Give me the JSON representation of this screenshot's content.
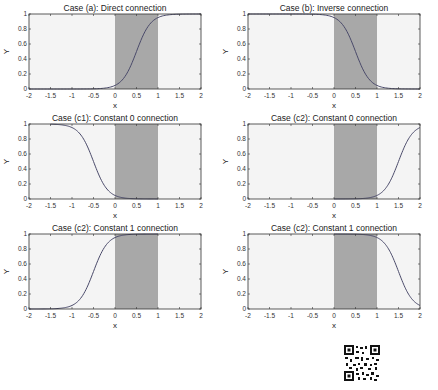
{
  "chart_data": [
    {
      "type": "line",
      "title": "Case (a): Direct connection",
      "xlabel": "x",
      "ylabel": "Y",
      "xlim": [
        -2,
        2
      ],
      "ylim": [
        0,
        1
      ],
      "xticks": [
        "-2",
        "-1.5",
        "-1",
        "-0.5",
        "0",
        "0.5",
        "1",
        "1.5",
        "2"
      ],
      "yticks": [
        "0",
        "0.2",
        "0.4",
        "0.6",
        "0.8",
        "1"
      ],
      "shaded_region": [
        0,
        1
      ],
      "curve": {
        "kind": "sigmoid",
        "center": 0.5,
        "direction": "increasing"
      },
      "x": [
        -2,
        -1.5,
        -1,
        -0.5,
        0,
        0.25,
        0.5,
        0.75,
        1,
        1.5,
        2
      ],
      "y": [
        0,
        0,
        0,
        0.01,
        0.05,
        0.2,
        0.5,
        0.8,
        0.95,
        0.99,
        1
      ]
    },
    {
      "type": "line",
      "title": "Case (b): Inverse connection",
      "xlabel": "x",
      "ylabel": "Y",
      "xlim": [
        -2,
        2
      ],
      "ylim": [
        0,
        1
      ],
      "xticks": [
        "-2",
        "-1.5",
        "-1",
        "-0.5",
        "0",
        "0.5",
        "1",
        "1.5",
        "2"
      ],
      "yticks": [
        "0",
        "0.2",
        "0.4",
        "0.6",
        "0.8",
        "1"
      ],
      "shaded_region": [
        0,
        1
      ],
      "curve": {
        "kind": "sigmoid",
        "center": 0.5,
        "direction": "decreasing"
      },
      "x": [
        -2,
        -1.5,
        -1,
        -0.5,
        0,
        0.25,
        0.5,
        0.75,
        1,
        1.5,
        2
      ],
      "y": [
        1,
        1,
        1,
        0.99,
        0.95,
        0.8,
        0.5,
        0.2,
        0.05,
        0.01,
        0
      ]
    },
    {
      "type": "line",
      "title": "Case (c1): Constant 0 connection",
      "xlabel": "x",
      "ylabel": "Y",
      "xlim": [
        -2,
        2
      ],
      "ylim": [
        0,
        1
      ],
      "xticks": [
        "-2",
        "-1.5",
        "-1",
        "-0.5",
        "0",
        "0.5",
        "1",
        "1.5",
        "2"
      ],
      "yticks": [
        "0",
        "0.2",
        "0.4",
        "0.6",
        "0.8",
        "1"
      ],
      "shaded_region": [
        0,
        1
      ],
      "curve": {
        "kind": "sigmoid",
        "center": -0.5,
        "direction": "decreasing"
      },
      "x": [
        -1.5,
        -1,
        -0.75,
        -0.5,
        -0.25,
        0,
        0.5,
        1
      ],
      "y": [
        0.99,
        0.95,
        0.8,
        0.5,
        0.2,
        0.05,
        0.01,
        0
      ]
    },
    {
      "type": "line",
      "title": "Case (c2): Constant 0 connection",
      "xlabel": "x",
      "ylabel": "Y",
      "xlim": [
        -2,
        2
      ],
      "ylim": [
        0,
        1
      ],
      "xticks": [
        "-2",
        "-1.5",
        "-1",
        "-0.5",
        "0",
        "0.5",
        "1",
        "1.5",
        "2"
      ],
      "yticks": [
        "0",
        "0.2",
        "0.4",
        "0.6",
        "0.8",
        "1"
      ],
      "shaded_region": [
        0,
        1
      ],
      "curve": {
        "kind": "sigmoid",
        "center": 1.5,
        "direction": "increasing"
      },
      "x": [
        0,
        0.5,
        1,
        1.25,
        1.5,
        1.75,
        2
      ],
      "y": [
        0,
        0.01,
        0.05,
        0.2,
        0.5,
        0.8,
        0.9
      ]
    },
    {
      "type": "line",
      "title": "Case (c2): Constant 1 connection",
      "xlabel": "x",
      "ylabel": "Y",
      "xlim": [
        -2,
        2
      ],
      "ylim": [
        0,
        1
      ],
      "xticks": [
        "-2",
        "-1.5",
        "-1",
        "-0.5",
        "0",
        "0.5",
        "1",
        "1.5",
        "2"
      ],
      "yticks": [
        "0",
        "0.2",
        "0.4",
        "0.6",
        "0.8",
        "1"
      ],
      "shaded_region": [
        0,
        1
      ],
      "curve": {
        "kind": "sigmoid",
        "center": -0.5,
        "direction": "increasing"
      },
      "x": [
        -2,
        -1.5,
        -1,
        -0.75,
        -0.5,
        -0.25,
        0,
        0.5,
        1
      ],
      "y": [
        0,
        0.01,
        0.05,
        0.2,
        0.5,
        0.8,
        0.95,
        0.99,
        1
      ]
    },
    {
      "type": "line",
      "title": "Case (c2): Constant 1 connection",
      "xlabel": "x",
      "ylabel": "Y",
      "xlim": [
        -2,
        2
      ],
      "ylim": [
        0,
        1
      ],
      "xticks": [
        "-2",
        "-1.5",
        "-1",
        "-0.5",
        "0",
        "0.5",
        "1",
        "1.5",
        "2"
      ],
      "yticks": [
        "0",
        "0.2",
        "0.4",
        "0.6",
        "0.8",
        "1"
      ],
      "shaded_region": [
        0,
        1
      ],
      "curve": {
        "kind": "sigmoid",
        "center": 1.5,
        "direction": "decreasing"
      },
      "x": [
        0,
        0.5,
        1,
        1.25,
        1.5,
        1.75,
        2
      ],
      "y": [
        1,
        0.99,
        0.95,
        0.8,
        0.5,
        0.2,
        0.08
      ]
    }
  ],
  "colors": {
    "plot_bg": "#f4f4f4",
    "shade": "#a8a8a8",
    "curve": "#4a4a6a",
    "axis": "#333333"
  },
  "qr": {
    "label": "qr-code"
  }
}
